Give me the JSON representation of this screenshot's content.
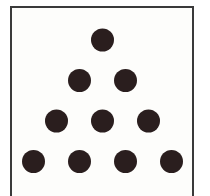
{
  "diagram": {
    "title": "",
    "rows": [
      1,
      2,
      3,
      4
    ],
    "total_dots": 10,
    "colors": {
      "dot": "#2a1e1e",
      "border": "#3a3a3a",
      "background": "#fdfdfb"
    }
  }
}
